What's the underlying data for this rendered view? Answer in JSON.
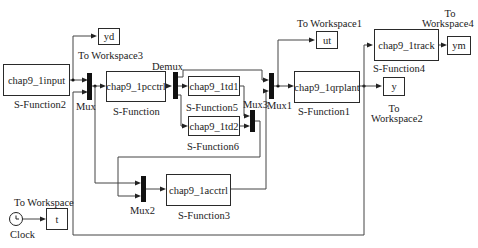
{
  "diagram": {
    "type": "simulink-block-diagram",
    "blocks": {
      "sf2": {
        "text": "chap9_1input",
        "caption": "S-Function2"
      },
      "sf": {
        "text": "chap9_1pcctrl",
        "caption": "S-Function"
      },
      "sf5": {
        "text": "chap9_1td1",
        "caption": "S-Function5"
      },
      "sf6": {
        "text": "chap9_1td2",
        "caption": "S-Function6"
      },
      "sf3": {
        "text": "chap9_1acctrl",
        "caption": "S-Function3"
      },
      "sf1": {
        "text": "chap9_1qrplant",
        "caption": "S-Function1"
      },
      "sf4": {
        "text": "chap9_1track",
        "caption": "S-Function4"
      },
      "ws3": {
        "text": "yd",
        "caption": "To Workspace3"
      },
      "ws1": {
        "text": "ut",
        "caption": "To Workspace1"
      },
      "ws4": {
        "text": "ym",
        "caption_line1": "To",
        "caption_line2": "Workspace4"
      },
      "ws2": {
        "text": "y",
        "caption_line1": "To",
        "caption_line2": "Workspace2"
      },
      "ws": {
        "text": "t",
        "caption": "To Workspace"
      },
      "clock": {
        "caption": "Clock",
        "icon": "clock-icon"
      }
    },
    "muxes": {
      "mux": {
        "caption": "Mux"
      },
      "demux": {
        "caption": "Demux"
      },
      "mux1": {
        "caption": "Mux1"
      },
      "mux2": {
        "caption": "Mux2"
      },
      "mux3": {
        "caption": "Mux3"
      }
    }
  }
}
